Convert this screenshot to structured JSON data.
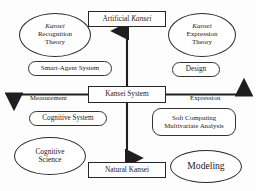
{
  "diagram": {
    "colors": {
      "background": "#fdfdfd",
      "stroke": "#262626",
      "text": "#1a1a1a"
    },
    "core_nodes": [
      {
        "id": "artificial-kansei",
        "label_plain": "Artificial ",
        "label_italic": "Kansei",
        "shape": "rect"
      },
      {
        "id": "kansei-system",
        "label_plain": "Kansei System",
        "label_italic": "",
        "shape": "rect"
      },
      {
        "id": "natural-kansei",
        "label_plain": "Natural Kansei",
        "label_italic": "",
        "shape": "rect"
      }
    ],
    "ellipse_nodes": [
      {
        "id": "kansei-recognition-theory",
        "line1_italic": "Kansei",
        "line2": "Recognition",
        "line3": "Theory"
      },
      {
        "id": "kansei-expression-theory",
        "line1_italic": "Kansei",
        "line2": "Expression",
        "line3": "Theory"
      },
      {
        "id": "cognitive-science",
        "line1": "Cognitive",
        "line2": "Science"
      },
      {
        "id": "modeling",
        "line1": "Modeling"
      }
    ],
    "rounded_nodes": [
      {
        "id": "smart-agent-system",
        "label": "Smart-Agent System"
      },
      {
        "id": "design",
        "label": "Design"
      },
      {
        "id": "cognitive-system",
        "label": "Cognitive System"
      },
      {
        "id": "soft-computing",
        "line1": "Soft Computing",
        "line2": "Multivariate Analysis"
      }
    ],
    "axis_labels": {
      "left": "Measurement",
      "right": "Expression"
    },
    "arrows": [
      {
        "name": "arrow-up-to-artificial-kansei",
        "direction": "up"
      },
      {
        "name": "arrow-down-to-natural-kansei",
        "direction": "down"
      },
      {
        "name": "arrow-left-measurement",
        "direction": "left"
      },
      {
        "name": "arrow-right-expression",
        "direction": "right"
      }
    ]
  }
}
